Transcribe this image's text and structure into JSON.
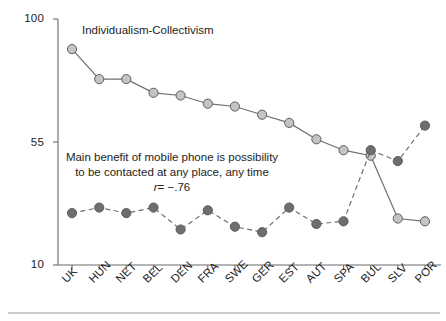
{
  "chart_data": {
    "type": "line",
    "title": "",
    "xlabel": "",
    "ylabel": "",
    "ylim": [
      10,
      100
    ],
    "yticks": [
      10,
      55,
      100
    ],
    "ytick_labels": [
      "10",
      "55",
      "100"
    ],
    "grid": false,
    "legend_position": "inline-annotation",
    "categories": [
      "UK",
      "HUN",
      "NET",
      "BEL",
      "DEN",
      "FRA",
      "SWE",
      "GER",
      "EST",
      "AUT",
      "SPA",
      "BUL",
      "SLV",
      "POR"
    ],
    "series": [
      {
        "name": "Individualism-Collectivism",
        "style": "solid",
        "marker_color": "#c4c4c4",
        "line_color": "#6e6e6e",
        "values": [
          89,
          78,
          78,
          73,
          72,
          69,
          68,
          65,
          62,
          56,
          52,
          50,
          27,
          26
        ]
      },
      {
        "name": "Main benefit of mobile phone is possibility to be contacted at any place, any time",
        "style": "dashed",
        "marker_color": "#6e6e6e",
        "line_color": "#6e6e6e",
        "values": [
          29,
          31,
          29,
          31,
          23,
          30,
          24,
          22,
          31,
          25,
          26,
          52,
          48,
          61
        ]
      }
    ],
    "annotations": [
      {
        "name": "series-1-label",
        "text": "Individualism-Collectivism"
      },
      {
        "name": "series-2-annotation",
        "line1": "Main benefit of mobile phone is possibility",
        "line2": "to be contacted at any place, any time",
        "stat_symbol": "r",
        "stat_value": "= −.76"
      }
    ]
  },
  "axis": {
    "y_labels": [
      "100",
      "55",
      "10"
    ],
    "x_labels": [
      "UK",
      "HUN",
      "NET",
      "BEL",
      "DEN",
      "FRA",
      "SWE",
      "GER",
      "EST",
      "AUT",
      "SPA",
      "BUL",
      "SLV",
      "POR"
    ]
  },
  "colors": {
    "axis": "#6b6b6b",
    "series1_marker": "#c4c4c4",
    "series2_marker": "#6e6e6e",
    "line": "#6e6e6e",
    "text": "#1d1d1d",
    "rule": "#9a9a9a"
  }
}
